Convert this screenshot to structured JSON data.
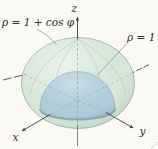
{
  "figure": {
    "labels": {
      "outer_surface": "ρ = 1 + cos φ",
      "inner_surface": "ρ = 1",
      "axis_x": "x",
      "axis_y": "y",
      "axis_z": "z"
    },
    "colors": {
      "outer_surface_fill": "#d6e7d8",
      "outer_surface_edge": "#9bb3a2",
      "inner_surface_fill": "#adccda",
      "inner_surface_edge": "#8fb3c6",
      "equator_band": "#7fa6ba",
      "axis_line": "#3c3c3c",
      "hidden_line": "#8a9a90",
      "leader_line": "#8a8a8a",
      "label_text": "#2e2e2e",
      "background": "#fbf9f4"
    }
  }
}
